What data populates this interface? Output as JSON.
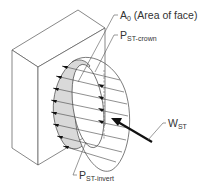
{
  "diagram": {
    "type": "isometric engineering diagram",
    "colors": {
      "line": "#444444",
      "shade": "#d9d9d9",
      "background": "#ffffff",
      "arrow": "#111111"
    },
    "labels": {
      "area": {
        "main": "A",
        "sub": "0",
        "rest": " (Area of face)"
      },
      "crown": {
        "main": "P",
        "sub": "ST-crown"
      },
      "load": {
        "main": "W",
        "sub": "ST"
      },
      "invert": {
        "main": "P",
        "sub": "ST-invert"
      }
    }
  }
}
